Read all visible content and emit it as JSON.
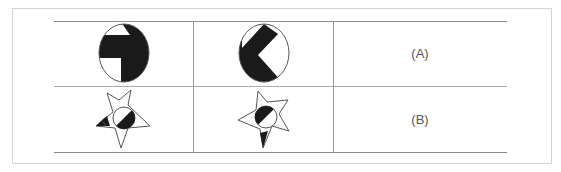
{
  "table": {
    "rows": [
      {
        "label": "(A)",
        "figures": [
          "circle-t-shape",
          "circle-k-shape"
        ]
      },
      {
        "label": "(B)",
        "figures": [
          "star-circle-left-wedge",
          "star-circle-bottom-wedge"
        ]
      }
    ]
  },
  "colors": {
    "fill": "#1a1a1a",
    "line": "#555555",
    "border": "#d4d4d4"
  }
}
